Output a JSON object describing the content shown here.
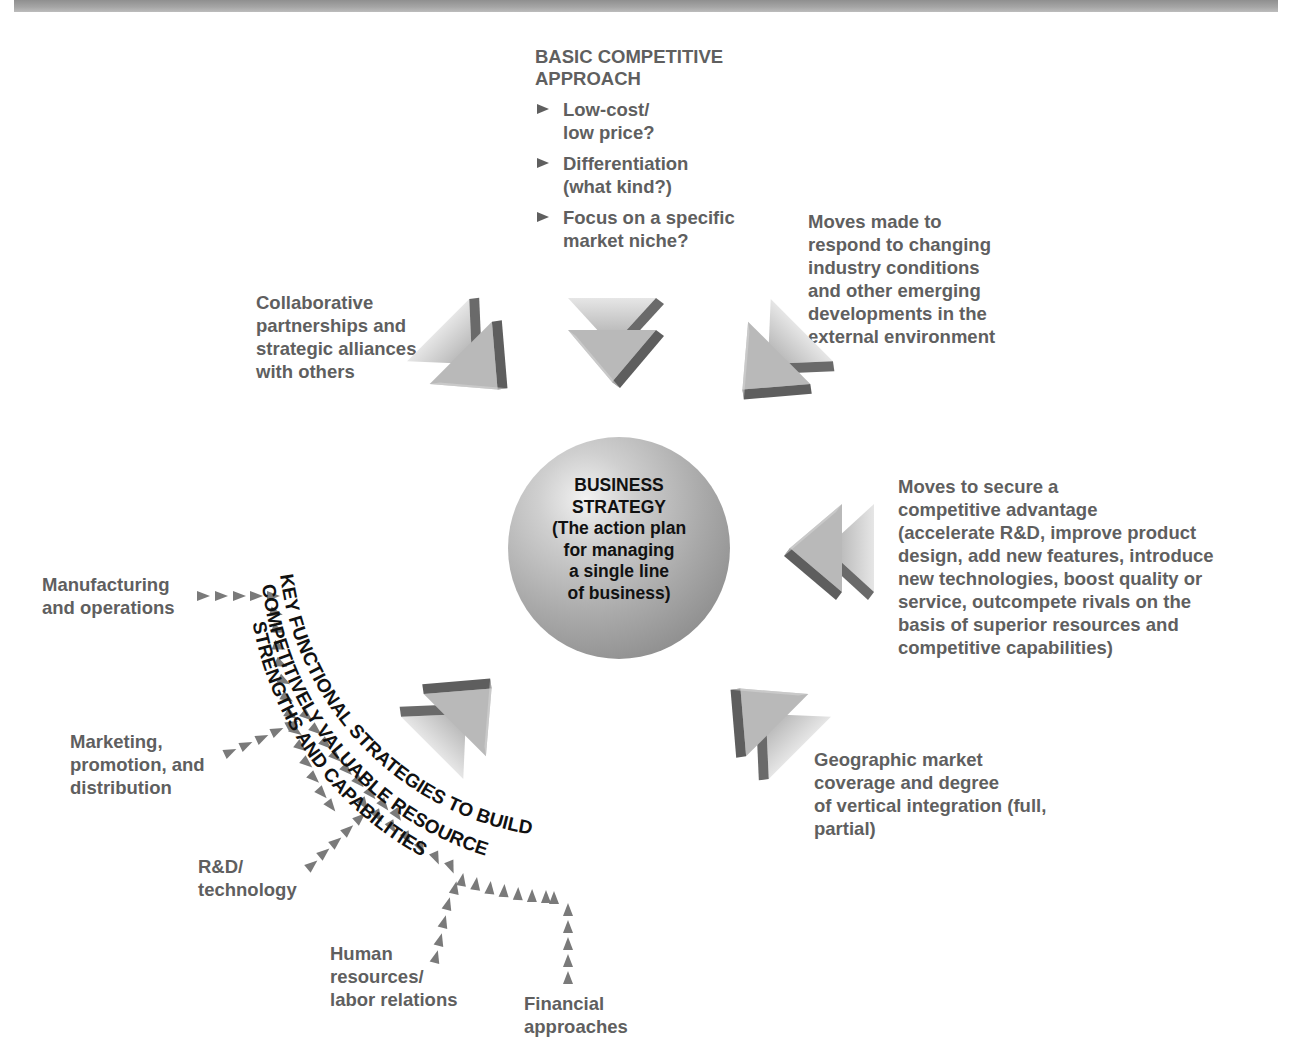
{
  "header_band": {
    "color": "#9e9e9e"
  },
  "center": {
    "title": [
      "BUSINESS",
      "STRATEGY"
    ],
    "subtitle": [
      "(The action plan",
      "for managing",
      "a single line",
      "of business)"
    ]
  },
  "basic_approach": {
    "title": [
      "BASIC COMPETITIVE",
      "APPROACH"
    ],
    "options": [
      {
        "lines": [
          "Low-cost/",
          "low price?"
        ]
      },
      {
        "lines": [
          "Differentiation",
          "(what kind?)"
        ]
      },
      {
        "lines": [
          "Focus on a specific",
          "market niche?"
        ]
      }
    ]
  },
  "influences": {
    "collaborative": [
      "Collaborative",
      "partnerships and",
      "strategic alliances",
      "with others"
    ],
    "industry_moves": [
      "Moves made to",
      "respond to changing",
      "industry conditions",
      "and other emerging",
      "developments in the",
      "external environment"
    ],
    "competitive_advantage": [
      "Moves to secure a",
      "competitive advantage",
      "(accelerate R&D, improve product",
      "design, add new features, introduce",
      "new technologies, boost quality or",
      "service, outcompete rivals on the",
      "basis of superior resources and",
      "competitive capabilities)"
    ],
    "geographic": [
      "Geographic market",
      "coverage and degree",
      "of vertical integration (full,",
      "partial)"
    ]
  },
  "functional": {
    "arc_lines": [
      "KEY FUNCTIONAL STRATEGIES TO BUILD",
      "COMPETITIVELY VALUABLE RESOURCE",
      "STRENGTHS AND CAPABILITIES"
    ],
    "areas": {
      "manufacturing": [
        "Manufacturing",
        "and operations"
      ],
      "marketing": [
        "Marketing,",
        "promotion, and",
        "distribution"
      ],
      "rnd": [
        "R&D/",
        "technology"
      ],
      "hr": [
        "Human",
        "resources/",
        "labor relations"
      ],
      "financial": [
        "Financial",
        "approaches"
      ]
    }
  },
  "colors": {
    "label_gray": "#5f5f5f",
    "arrow_light": "#bdbdbd",
    "arrow_dark": "#6a6a6a",
    "dot_arrow": "#7a7a7a",
    "center_text": "#111111"
  }
}
